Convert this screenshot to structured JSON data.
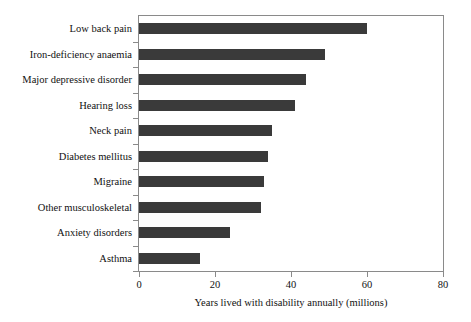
{
  "chart_data": {
    "type": "bar",
    "orientation": "horizontal",
    "title": "",
    "xlabel": "Years lived with disability annually (millions)",
    "ylabel": "",
    "xlim": [
      0,
      80
    ],
    "xticks": [
      0,
      20,
      40,
      60,
      80
    ],
    "xtick_labels": [
      "0",
      "20",
      "40",
      "60",
      "80"
    ],
    "grid": false,
    "legend": null,
    "bar_color": "#3a3a3a",
    "frame_color": "#8a8a8a",
    "categories": [
      "Low back pain",
      "Iron-deficiency anaemia",
      "Major depressive disorder",
      "Hearing loss",
      "Neck pain",
      "Diabetes mellitus",
      "Migraine",
      "Other musculoskeletal",
      "Anxiety disorders",
      "Asthma"
    ],
    "values": [
      60,
      49,
      44,
      41,
      35,
      34,
      33,
      32,
      24,
      16
    ]
  }
}
